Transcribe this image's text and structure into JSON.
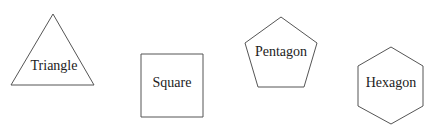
{
  "diagram": {
    "background": "#ffffff",
    "stroke_color": "#555555",
    "text_color": "#222222",
    "shapes": [
      {
        "name": "triangle",
        "label": "Triangle",
        "points": "53,14 11,85 94,85",
        "label_x": 54,
        "label_y": 67
      },
      {
        "name": "square",
        "label": "Square",
        "points": "141,54 203,54 203,117 141,117",
        "label_x": 172,
        "label_y": 84
      },
      {
        "name": "pentagon",
        "label": "Pentagon",
        "points": "281,17 317,43 304,87 258,87 245,43",
        "label_x": 281,
        "label_y": 53
      },
      {
        "name": "hexagon",
        "label": "Hexagon",
        "points": "391,47 423,66 423,106 391,124 358,106 358,66",
        "label_x": 391,
        "label_y": 84
      }
    ]
  }
}
